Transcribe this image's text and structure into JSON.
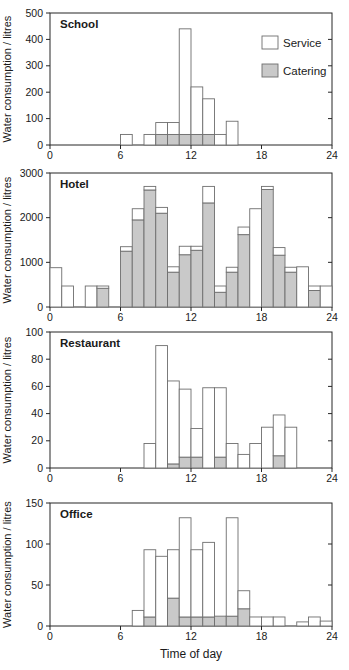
{
  "figure": {
    "xlabel": "Time of day",
    "ylabel": "Water consumption / litres",
    "legend": {
      "items": [
        {
          "label": "Service",
          "fill": "#ffffff"
        },
        {
          "label": "Catering",
          "fill": "#c9c9c9"
        }
      ],
      "position": "top-right-inside-first-panel"
    },
    "colors": {
      "service_fill": "#ffffff",
      "catering_fill": "#c9c9c9",
      "bar_stroke": "#6e6e6e",
      "axis": "#262626",
      "text": "#1a1a1a",
      "background": "#ffffff"
    }
  },
  "chart_data": [
    {
      "type": "bar",
      "stacked": true,
      "title": "School",
      "ylabel": "Water consumption / litres",
      "xlabel": "",
      "ylim": [
        0,
        500
      ],
      "yticks": [
        0,
        100,
        200,
        300,
        400,
        500
      ],
      "xlim": [
        0,
        24
      ],
      "xticks": [
        0,
        6,
        12,
        18,
        24
      ],
      "bar_width_hours": 1,
      "series_names": [
        "Catering",
        "Service"
      ],
      "grid": false,
      "show_legend": true,
      "bars": [
        {
          "hour": 6,
          "catering": 0,
          "service": 40
        },
        {
          "hour": 8,
          "catering": 0,
          "service": 40
        },
        {
          "hour": 9,
          "catering": 40,
          "service": 45
        },
        {
          "hour": 10,
          "catering": 40,
          "service": 45
        },
        {
          "hour": 11,
          "catering": 40,
          "service": 400
        },
        {
          "hour": 12,
          "catering": 40,
          "service": 180
        },
        {
          "hour": 13,
          "catering": 40,
          "service": 135
        },
        {
          "hour": 14,
          "catering": 0,
          "service": 40
        },
        {
          "hour": 15,
          "catering": 0,
          "service": 90
        }
      ]
    },
    {
      "type": "bar",
      "stacked": true,
      "title": "Hotel",
      "ylabel": "Water consumption / litres",
      "xlabel": "",
      "ylim": [
        0,
        3000
      ],
      "yticks": [
        0,
        1000,
        2000,
        3000
      ],
      "xlim": [
        0,
        24
      ],
      "xticks": [
        0,
        6,
        12,
        18,
        24
      ],
      "bar_width_hours": 1,
      "series_names": [
        "Catering",
        "Service"
      ],
      "grid": false,
      "show_legend": false,
      "bars": [
        {
          "hour": 0,
          "catering": 0,
          "service": 880
        },
        {
          "hour": 1,
          "catering": 0,
          "service": 470
        },
        {
          "hour": 3,
          "catering": 0,
          "service": 470
        },
        {
          "hour": 4,
          "catering": 420,
          "service": 50
        },
        {
          "hour": 6,
          "catering": 1250,
          "service": 100
        },
        {
          "hour": 7,
          "catering": 1950,
          "service": 250
        },
        {
          "hour": 8,
          "catering": 2620,
          "service": 80
        },
        {
          "hour": 9,
          "catering": 2100,
          "service": 130
        },
        {
          "hour": 10,
          "catering": 780,
          "service": 120
        },
        {
          "hour": 11,
          "catering": 1170,
          "service": 190
        },
        {
          "hour": 12,
          "catering": 1270,
          "service": 90
        },
        {
          "hour": 13,
          "catering": 2330,
          "service": 370
        },
        {
          "hour": 14,
          "catering": 330,
          "service": 140
        },
        {
          "hour": 15,
          "catering": 780,
          "service": 110
        },
        {
          "hour": 16,
          "catering": 1620,
          "service": 170
        },
        {
          "hour": 17,
          "catering": 0,
          "service": 2200
        },
        {
          "hour": 18,
          "catering": 2630,
          "service": 70
        },
        {
          "hour": 19,
          "catering": 1160,
          "service": 170
        },
        {
          "hour": 20,
          "catering": 780,
          "service": 110
        },
        {
          "hour": 21,
          "catering": 0,
          "service": 900
        },
        {
          "hour": 22,
          "catering": 370,
          "service": 100
        },
        {
          "hour": 23,
          "catering": 0,
          "service": 470
        }
      ]
    },
    {
      "type": "bar",
      "stacked": true,
      "title": "Restaurant",
      "ylabel": "Water consumption / litres",
      "xlabel": "",
      "ylim": [
        0,
        100
      ],
      "yticks": [
        0,
        20,
        40,
        60,
        80,
        100
      ],
      "xlim": [
        0,
        24
      ],
      "xticks": [
        0,
        6,
        12,
        18,
        24
      ],
      "bar_width_hours": 1,
      "series_names": [
        "Catering",
        "Service"
      ],
      "grid": false,
      "show_legend": false,
      "bars": [
        {
          "hour": 8,
          "catering": 0,
          "service": 18
        },
        {
          "hour": 9,
          "catering": 0,
          "service": 90
        },
        {
          "hour": 10,
          "catering": 3,
          "service": 61
        },
        {
          "hour": 11,
          "catering": 8,
          "service": 50
        },
        {
          "hour": 12,
          "catering": 8,
          "service": 21
        },
        {
          "hour": 13,
          "catering": 0,
          "service": 59
        },
        {
          "hour": 14,
          "catering": 8,
          "service": 51
        },
        {
          "hour": 15,
          "catering": 0,
          "service": 18
        },
        {
          "hour": 16,
          "catering": 0,
          "service": 10
        },
        {
          "hour": 17,
          "catering": 0,
          "service": 18
        },
        {
          "hour": 18,
          "catering": 0,
          "service": 30
        },
        {
          "hour": 19,
          "catering": 9,
          "service": 30
        },
        {
          "hour": 20,
          "catering": 0,
          "service": 30
        }
      ]
    },
    {
      "type": "bar",
      "stacked": true,
      "title": "Office",
      "ylabel": "Water consumption / litres",
      "xlabel": "Time of day",
      "ylim": [
        0,
        150
      ],
      "yticks": [
        0,
        50,
        100,
        150
      ],
      "xlim": [
        0,
        24
      ],
      "xticks": [
        0,
        6,
        12,
        18,
        24
      ],
      "bar_width_hours": 1,
      "series_names": [
        "Catering",
        "Service"
      ],
      "grid": false,
      "show_legend": false,
      "bars": [
        {
          "hour": 7,
          "catering": 0,
          "service": 19
        },
        {
          "hour": 8,
          "catering": 11,
          "service": 82
        },
        {
          "hour": 9,
          "catering": 0,
          "service": 85
        },
        {
          "hour": 10,
          "catering": 34,
          "service": 59
        },
        {
          "hour": 11,
          "catering": 11,
          "service": 121
        },
        {
          "hour": 12,
          "catering": 11,
          "service": 82
        },
        {
          "hour": 13,
          "catering": 11,
          "service": 91
        },
        {
          "hour": 14,
          "catering": 12,
          "service": 0
        },
        {
          "hour": 15,
          "catering": 12,
          "service": 120
        },
        {
          "hour": 16,
          "catering": 21,
          "service": 22
        },
        {
          "hour": 17,
          "catering": 0,
          "service": 11
        },
        {
          "hour": 18,
          "catering": 0,
          "service": 11
        },
        {
          "hour": 19,
          "catering": 0,
          "service": 11
        },
        {
          "hour": 21,
          "catering": 0,
          "service": 5
        },
        {
          "hour": 22,
          "catering": 0,
          "service": 11
        },
        {
          "hour": 23,
          "catering": 0,
          "service": 6
        }
      ]
    }
  ]
}
